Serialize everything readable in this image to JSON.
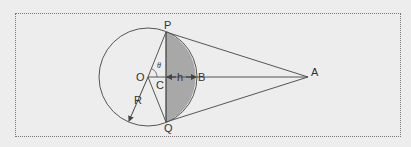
{
  "diagram": {
    "labels": {
      "P": "P",
      "Q": "Q",
      "O": "O",
      "C": "C",
      "B": "B",
      "A": "A",
      "h": "h",
      "R": "R",
      "theta": "θ"
    },
    "colors": {
      "background": "#ededed",
      "stroke": "#555555",
      "segment_fill": "#a8a8a8",
      "frame": "#777777"
    }
  }
}
